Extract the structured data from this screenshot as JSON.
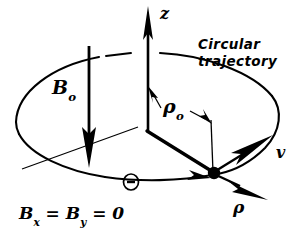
{
  "figure": {
    "kind": "physics-vector-diagram",
    "background_color": "#ffffff",
    "ink_color": "#000000",
    "width": 308,
    "height": 242
  },
  "labels": {
    "z_axis": "z",
    "b_field": "B",
    "b_field_subscript": "o",
    "radius": "ρ",
    "radius_subscript": "o",
    "velocity": "v",
    "rho_unit_vector": "ρ",
    "trajectory_line1": "Circular",
    "trajectory_line2": "trajectory",
    "condition_b": "B",
    "condition_sub_x": "x",
    "condition_eq1": " = ",
    "condition_b2": "B",
    "condition_sub_y": "y",
    "condition_eq2": " = 0"
  },
  "elements": {
    "z_axis_arrow": "z-axis-arrow",
    "b0_arrow": "b0-field-arrow",
    "trajectory_ellipse": "circular-trajectory-ellipse",
    "radial_line": "radial-line-to-particle",
    "drop_line": "vertical-drop-line",
    "particle": "charged-particle-dot",
    "velocity_arrow": "velocity-vector-arrow",
    "rho_arrow": "rho-unit-vector-arrow",
    "dimension_arrow": "rho0-dimension-arrow",
    "motion_arrow": "direction-of-motion-arrow",
    "out_of_page_symbol": "out-of-page-circle-symbol",
    "horizontal_axis": "horizontal-reference-axis",
    "leader_line": "trajectory-label-leader-line"
  },
  "geometry": {
    "origin": [
      148,
      131
    ],
    "particle": [
      215,
      173
    ],
    "z_tip": [
      148,
      8
    ],
    "ellipse_center": [
      148,
      118
    ],
    "ellipse_rx": 133,
    "ellipse_ry": 62
  }
}
